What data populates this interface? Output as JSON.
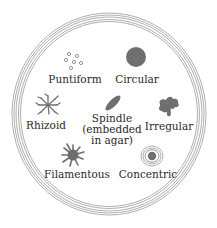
{
  "diagram": {
    "colors": {
      "ring": "#9a9a9a",
      "colony": "#6f6f6f",
      "text": "#2a2a2a"
    },
    "colonies": [
      {
        "id": "punctiform",
        "label": "Puntiform",
        "shape": "small-dots-icon"
      },
      {
        "id": "circular",
        "label": "Circular",
        "shape": "filled-circle-icon"
      },
      {
        "id": "rhizoid",
        "label": "Rhizoid",
        "shape": "branching-rhizoid-icon"
      },
      {
        "id": "spindle",
        "label_lines": [
          "Spindle",
          "(embedded",
          "in agar)"
        ],
        "shape": "spindle-ellipse-icon"
      },
      {
        "id": "irregular",
        "label": "Irregular",
        "shape": "irregular-blob-icon"
      },
      {
        "id": "filamentous",
        "label": "Filamentous",
        "shape": "filamentous-star-icon"
      },
      {
        "id": "concentric",
        "label": "Concentric",
        "shape": "concentric-rings-icon"
      }
    ]
  }
}
